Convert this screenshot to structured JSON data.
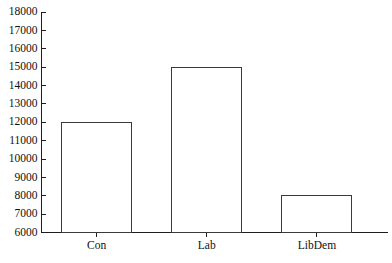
{
  "chart_data": {
    "type": "bar",
    "title": "",
    "subtitle": "",
    "xlabel": "",
    "ylabel": "",
    "categories": [
      "Con",
      "Lab",
      "LibDem"
    ],
    "values": [
      12000,
      15000,
      8000
    ],
    "ylim": [
      6000,
      18000
    ],
    "ytick_values": [
      6000,
      7000,
      8000,
      9000,
      10000,
      11000,
      12000,
      13000,
      14000,
      15000,
      16000,
      17000,
      18000
    ],
    "ytick_labels": [
      "6000",
      "7000",
      "8000",
      "9000",
      "10000",
      "11000",
      "12000",
      "13000",
      "14000",
      "15000",
      "16000",
      "17000",
      "18000"
    ],
    "grid": false,
    "legend": false,
    "legend_position": "none",
    "bar_fill": "#ffffff",
    "bar_edge_color": "#3a3a3a",
    "axis_color": "#1d1d1d",
    "background_color": "#ffffff",
    "text_color": "#111111",
    "annotations": []
  },
  "axes": {
    "y_axis_name": "y-axis",
    "x_axis_name": "x-axis"
  }
}
